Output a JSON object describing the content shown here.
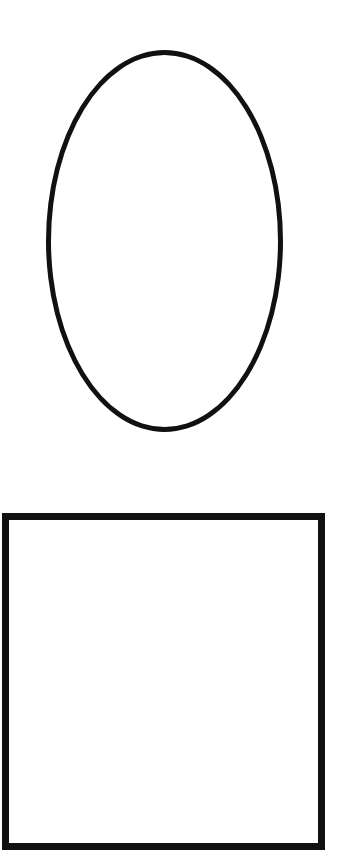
{
  "canvas": {
    "width": 340,
    "height": 866,
    "background": "#ffffff"
  },
  "shapes": [
    {
      "type": "ellipse",
      "name": "ellipse-shape",
      "x": 46,
      "y": 50,
      "width": 237,
      "height": 382,
      "stroke": "#111111",
      "stroke_width": 5,
      "fill": "#ffffff"
    },
    {
      "type": "rectangle",
      "name": "square-shape",
      "x": 2,
      "y": 513,
      "width": 323,
      "height": 337,
      "stroke": "#111111",
      "stroke_width": 7,
      "fill": "#ffffff"
    }
  ]
}
